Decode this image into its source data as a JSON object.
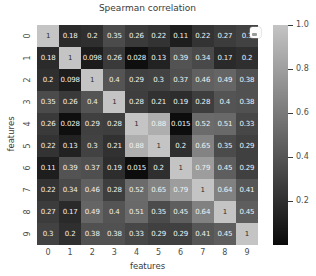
{
  "figure": {
    "title": "Spearman correlation",
    "xlabel": "features",
    "ylabel": "features"
  },
  "colorbar": {
    "tick_labels": [
      "1.0",
      "0.8",
      "0.6",
      "0.4",
      "0.2"
    ],
    "top_color": "#c4c4c4",
    "bottom_color": "#0a0a0a"
  },
  "chart_data": {
    "type": "heatmap",
    "title": "Spearman correlation",
    "xlabel": "features",
    "ylabel": "features",
    "x_ticklabels": [
      "0",
      "1",
      "2",
      "3",
      "4",
      "5",
      "6",
      "7",
      "8",
      "9"
    ],
    "y_ticklabels": [
      "0",
      "1",
      "2",
      "3",
      "4",
      "5",
      "6",
      "7",
      "8",
      "9"
    ],
    "colormap": "gray",
    "vmin": 0,
    "vmax": 1,
    "annotated": true,
    "legend_position": "right-colorbar",
    "values": [
      [
        "1",
        "0.18",
        "0.2",
        "0.35",
        "0.26",
        "0.22",
        "0.11",
        "0.22",
        "0.27",
        "0.3"
      ],
      [
        "0.18",
        "1",
        "0.098",
        "0.26",
        "0.028",
        "0.13",
        "0.39",
        "0.34",
        "0.17",
        "0.2"
      ],
      [
        "0.2",
        "0.098",
        "1",
        "0.4",
        "0.29",
        "0.3",
        "0.37",
        "0.46",
        "0.49",
        "0.38"
      ],
      [
        "0.35",
        "0.26",
        "0.4",
        "1",
        "0.28",
        "0.21",
        "0.19",
        "0.28",
        "0.4",
        "0.38"
      ],
      [
        "0.26",
        "0.028",
        "0.29",
        "0.28",
        "1",
        "0.88",
        "0.015",
        "0.52",
        "0.51",
        "0.33"
      ],
      [
        "0.22",
        "0.13",
        "0.3",
        "0.21",
        "0.88",
        "1",
        "0.2",
        "0.65",
        "0.35",
        "0.29"
      ],
      [
        "0.11",
        "0.39",
        "0.37",
        "0.19",
        "0.015",
        "0.2",
        "1",
        "0.79",
        "0.45",
        "0.29"
      ],
      [
        "0.22",
        "0.34",
        "0.46",
        "0.28",
        "0.52",
        "0.65",
        "0.79",
        "1",
        "0.64",
        "0.41"
      ],
      [
        "0.27",
        "0.17",
        "0.49",
        "0.4",
        "0.51",
        "0.35",
        "0.45",
        "0.64",
        "1",
        "0.45"
      ],
      [
        "0.3",
        "0.2",
        "0.38",
        "0.38",
        "0.33",
        "0.29",
        "0.29",
        "0.41",
        "0.45",
        "1"
      ]
    ]
  },
  "cursor": {
    "row": 0,
    "col": 9
  }
}
